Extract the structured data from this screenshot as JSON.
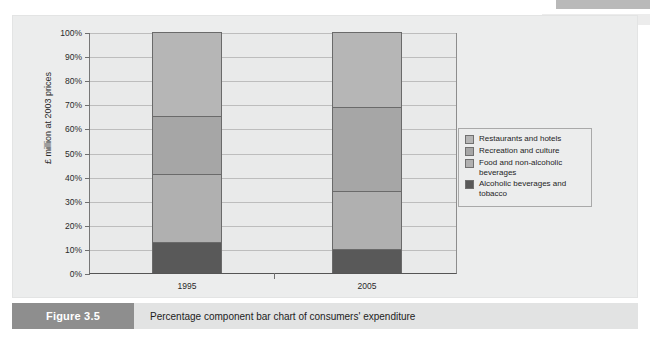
{
  "figure": {
    "tag": "Figure 3.5",
    "caption": "Percentage component bar chart of consumers' expenditure"
  },
  "colors": {
    "restaurants_and_hotels": "#b6b6b6",
    "recreation_and_culture": "#a6a6a6",
    "food_and_non_alcoholic_beverages": "#b0b0b0",
    "alcoholic_beverages_and_tobacco": "#595959",
    "plot_background": "#e9eaea",
    "card_background": "#eceded",
    "gridline": "#bdbdbd",
    "caption_tag_background": "#8e8e8e",
    "caption_body_background": "#e2e3e3"
  },
  "chart_data": {
    "type": "bar",
    "title": "",
    "subtitle": "",
    "stacked": true,
    "stack_mode": "percent",
    "xlabel": "",
    "ylabel": "£ million at 2003 prices",
    "categories": [
      "1995",
      "2005"
    ],
    "x_tick_labels": [
      "1995",
      "2005"
    ],
    "y_tick_labels": [
      "0%",
      "10%",
      "20%",
      "30%",
      "40%",
      "50%",
      "60%",
      "70%",
      "80%",
      "90%",
      "100%"
    ],
    "y_tick_values": [
      0,
      10,
      20,
      30,
      40,
      50,
      60,
      70,
      80,
      90,
      100
    ],
    "ylim": [
      0,
      100
    ],
    "grid": true,
    "grid_axis": "y",
    "legend_position": "right",
    "series": [
      {
        "name": "Restaurants and hotels",
        "color": "#b6b6b6",
        "values": [
          35,
          31
        ],
        "cumulative_top": [
          100,
          100
        ]
      },
      {
        "name": "Recreation and culture",
        "color": "#a6a6a6",
        "values": [
          24,
          35
        ],
        "cumulative_top": [
          65,
          69
        ]
      },
      {
        "name": "Food and non-alcoholic beverages",
        "color": "#b0b0b0",
        "values": [
          28,
          24
        ],
        "cumulative_top": [
          41,
          34
        ]
      },
      {
        "name": "Alcoholic beverages and tobacco",
        "color": "#595959",
        "values": [
          13,
          10
        ],
        "cumulative_top": [
          13,
          10
        ]
      }
    ]
  },
  "legend": {
    "items": [
      {
        "label": "Restaurants and hotels",
        "color": "#b6b6b6"
      },
      {
        "label": "Recreation and culture",
        "color": "#a6a6a6"
      },
      {
        "label": "Food and non-alcoholic beverages",
        "color": "#b0b0b0"
      },
      {
        "label": "Alcoholic beverages and tobacco",
        "color": "#595959"
      }
    ]
  }
}
